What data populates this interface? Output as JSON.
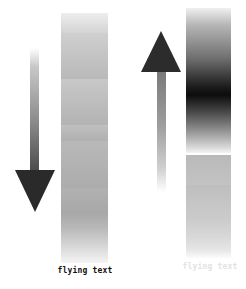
{
  "panels": [
    {
      "id": "left",
      "arrow": {
        "direction": "down",
        "icon": "arrow-down-icon"
      },
      "column": {
        "style": "banded-gray",
        "band_count": 6
      },
      "label": "flying text",
      "label_color": "#111111"
    },
    {
      "id": "right",
      "arrow": {
        "direction": "up",
        "icon": "arrow-up-icon"
      },
      "column": {
        "style": "dark-gradient-then-banded-gray"
      },
      "label": "flying text",
      "label_color": "#e2e2e2"
    }
  ]
}
